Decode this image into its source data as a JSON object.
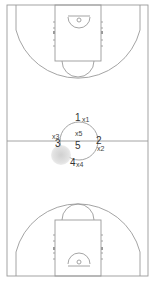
{
  "diagram": {
    "type": "basketball-full-court",
    "colors": {
      "line": "#9a9a9a",
      "background": "#ffffff",
      "text": "#333333",
      "shadow": "#d6d6d6"
    },
    "players": [
      {
        "id": "1",
        "label": "1",
        "x": 75,
        "y": 113
      },
      {
        "id": "2",
        "label": "2",
        "x": 96,
        "y": 136
      },
      {
        "id": "3",
        "label": "3",
        "x": 55,
        "y": 139
      },
      {
        "id": "4",
        "label": "4",
        "x": 70,
        "y": 159
      },
      {
        "id": "5",
        "label": "5",
        "x": 75,
        "y": 141
      }
    ],
    "markers": [
      {
        "id": "x1",
        "label": "x1",
        "x": 82,
        "y": 116
      },
      {
        "id": "x2",
        "label": "x2",
        "x": 97,
        "y": 145
      },
      {
        "id": "x3",
        "label": "x3",
        "x": 52,
        "y": 133
      },
      {
        "id": "x4",
        "label": "x4",
        "x": 76,
        "y": 161
      },
      {
        "id": "x5",
        "label": "x5",
        "x": 75,
        "y": 130
      }
    ]
  }
}
